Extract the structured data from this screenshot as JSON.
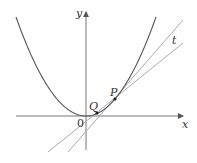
{
  "figure": {
    "type": "diagram",
    "colors": {
      "curve": "#555555",
      "axes": "#777777",
      "lines": "#aaaaaa",
      "points": "#222222",
      "text": "#333333"
    },
    "labels": {
      "y_axis": "y",
      "x_axis": "x",
      "origin": "0",
      "point_q": "Q",
      "point_p": "P",
      "tangent": "t"
    },
    "geometry": {
      "origin_px": [
        86,
        116
      ],
      "x_axis": {
        "from": [
          16,
          116
        ],
        "to": [
          183,
          116
        ]
      },
      "y_axis": {
        "from": [
          86,
          150
        ],
        "to": [
          86,
          12
        ]
      },
      "parabola": {
        "vertex": [
          86,
          116
        ],
        "through": [
          115,
          99
        ],
        "x_range": [
          16,
          156
        ]
      },
      "point_p": [
        115,
        99
      ],
      "point_q": [
        97,
        113
      ],
      "tangent_line_t": {
        "from": [
          48,
          152
        ],
        "to": [
          183,
          43
        ]
      },
      "secant_line_pq": {
        "from": [
          68,
          152
        ],
        "to": [
          183,
          20
        ]
      }
    }
  }
}
